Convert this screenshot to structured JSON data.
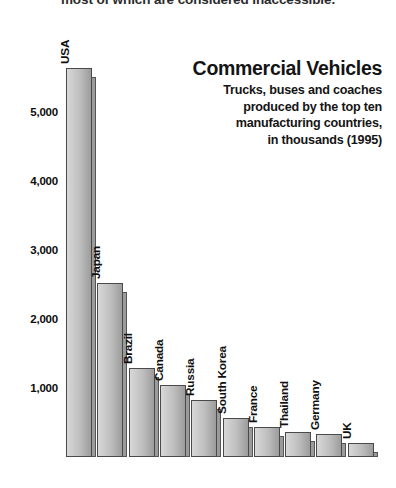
{
  "page": {
    "clipped_text_above": "most of which are considered inaccessible."
  },
  "chart_data": {
    "type": "bar",
    "title": "Commercial Vehicles",
    "subtitle_lines": [
      "Trucks, buses and coaches",
      "produced by the top ten",
      "manufacturing countries,",
      "in thousands (1995)"
    ],
    "xlabel": "",
    "ylabel": "",
    "ylim": [
      0,
      5800
    ],
    "grid": false,
    "legend": null,
    "ytick_labels": [
      "1,000",
      "2,000",
      "3,000",
      "4,000",
      "5,000"
    ],
    "ytick_values": [
      1000,
      2000,
      3000,
      4000,
      5000
    ],
    "categories": [
      "USA",
      "Japan",
      "Brazil",
      "Canada",
      "Russia",
      "South Korea",
      "France",
      "Thailand",
      "Germany",
      "UK"
    ],
    "values": [
      5640,
      2520,
      1290,
      1045,
      830,
      565,
      435,
      360,
      330,
      200
    ],
    "bar_fill_light": "#d8d8d8",
    "bar_fill_dark": "#9c9c9c",
    "bar_shadow_color": "#9b9b9b",
    "bar_outline_color": "#4a4a4a",
    "text_color": "#101010",
    "background_color": "#ffffff"
  }
}
